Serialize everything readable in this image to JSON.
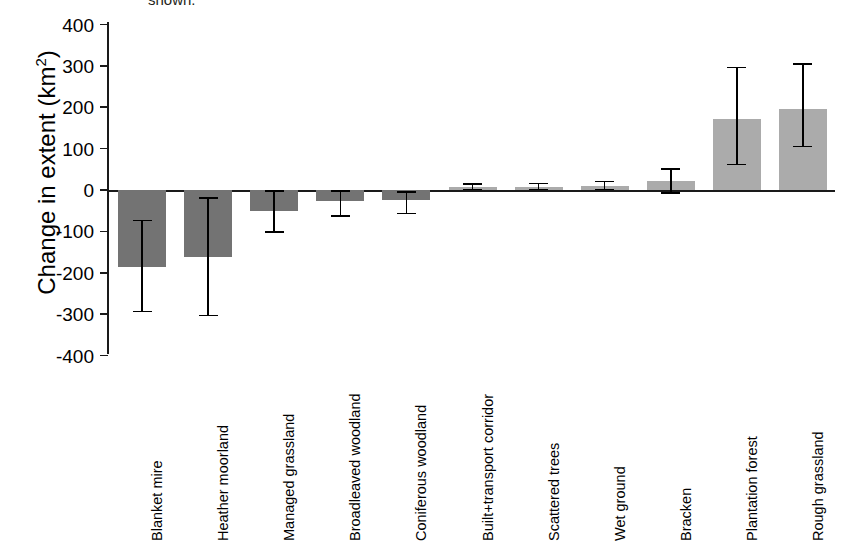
{
  "figure": {
    "caption_fragment": "shown.",
    "y_axis_title": "Change in extent (km",
    "y_axis_title_sup": "2",
    "y_axis_title_tail": ")"
  },
  "chart_data": {
    "type": "bar",
    "title": "",
    "xlabel": "",
    "ylabel": "Change in extent (km2)",
    "ylim": [
      -400,
      400
    ],
    "ytick_labels": [
      "400",
      "300",
      "200",
      "100",
      "0",
      "-100",
      "-200",
      "-300",
      "-400"
    ],
    "ytick_values": [
      400,
      300,
      200,
      100,
      0,
      -100,
      -200,
      -300,
      -400
    ],
    "grid": false,
    "legend": "none",
    "categories": [
      "Blanket mire",
      "Heather moorland",
      "Managed grassland",
      "Broadleaved woodland",
      "Coniferous woodland",
      "Built+transport corridor",
      "Scattered trees",
      "Wet ground",
      "Bracken",
      "Plantation forest",
      "Rough grassland"
    ],
    "values": [
      -185,
      -163,
      -50,
      -27,
      -25,
      7,
      8,
      10,
      21,
      172,
      195
    ],
    "error_upper": [
      -74,
      -19,
      -2,
      -3,
      -5,
      14,
      16,
      21,
      51,
      296,
      305
    ],
    "error_lower": [
      -294,
      -303,
      -102,
      -63,
      -57,
      1,
      1,
      1,
      -7,
      62,
      105
    ],
    "bar_colors": [
      "#737373",
      "#737373",
      "#737373",
      "#737373",
      "#737373",
      "#ababab",
      "#ababab",
      "#ababab",
      "#ababab",
      "#ababab",
      "#ababab"
    ],
    "error_bar_color": "#000000",
    "axis_color": "#1a1a1a"
  }
}
